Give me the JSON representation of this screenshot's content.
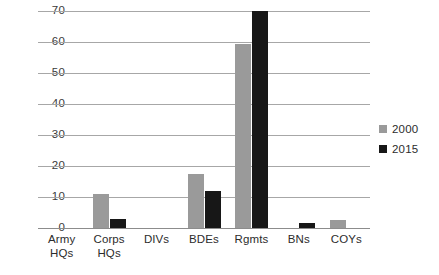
{
  "chart_data": {
    "type": "bar",
    "title": "",
    "subtitle": "",
    "xlabel": "",
    "ylabel": "",
    "ylim": [
      0,
      70
    ],
    "yticks": [
      0,
      10,
      20,
      30,
      40,
      50,
      60,
      70
    ],
    "grid": true,
    "legend_position": "right",
    "categories": [
      "Army\nHQs",
      "Corps\nHQs",
      "DIVs",
      "BDEs",
      "Rgmts",
      "BNs",
      "COYs"
    ],
    "category_labels": [
      [
        "Army",
        "HQs"
      ],
      [
        "Corps",
        "HQs"
      ],
      [
        "DIVs",
        ""
      ],
      [
        "BDEs",
        ""
      ],
      [
        "Rgmts",
        ""
      ],
      [
        "BNs",
        ""
      ],
      [
        "COYs",
        ""
      ]
    ],
    "series": [
      {
        "name": "2000",
        "color": "#9a9a9a",
        "values": [
          0,
          11,
          0,
          17.5,
          59.5,
          0,
          2.5
        ]
      },
      {
        "name": "2015",
        "color": "#171717",
        "values": [
          0,
          3,
          0,
          12,
          70,
          1.5,
          0
        ]
      }
    ]
  },
  "axis": {
    "ytick_labels": [
      "0",
      "10",
      "20",
      "30",
      "40",
      "50",
      "60",
      "70"
    ]
  },
  "legend": {
    "entries": [
      {
        "label": "2000",
        "color": "#9a9a9a"
      },
      {
        "label": "2015",
        "color": "#171717"
      }
    ]
  },
  "colors": {
    "series_2000": "#9a9a9a",
    "series_2015": "#171717",
    "gridline": "#a7a7a7",
    "background": "#ffffff",
    "text": "#2c2c2c"
  }
}
